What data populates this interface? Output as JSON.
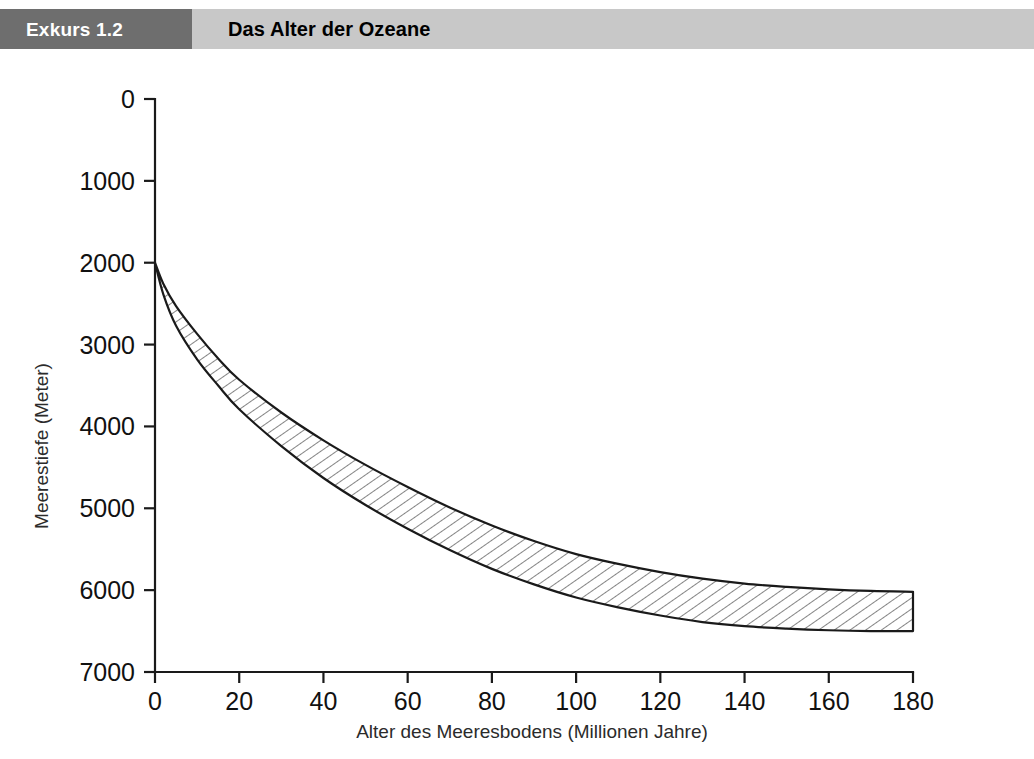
{
  "header": {
    "excursus_label": "Exkurs 1.2",
    "title": "Das Alter der Ozeane",
    "dark_box_color": "#6e6e6e",
    "light_bar_color": "#c8c8c8",
    "excursus_text_color": "#ffffff",
    "title_text_color": "#000000"
  },
  "chart_data": {
    "type": "area",
    "title": "Das Alter der Ozeane",
    "xlabel": "Alter des Meeresbodens (Millionen Jahre)",
    "ylabel": "Meerestiefe (Meter)",
    "xlim": [
      0,
      180
    ],
    "ylim": [
      0,
      7000
    ],
    "y_inverted": true,
    "grid": false,
    "legend": null,
    "xticks": [
      0,
      20,
      40,
      60,
      80,
      100,
      120,
      140,
      160,
      180
    ],
    "xtick_labels": [
      "0",
      "20",
      "40",
      "60",
      "80",
      "100",
      "120",
      "140",
      "160",
      "180"
    ],
    "yticks": [
      0,
      1000,
      2000,
      3000,
      4000,
      5000,
      6000,
      7000
    ],
    "ytick_labels": [
      "0",
      "1000",
      "2000",
      "3000",
      "4000",
      "5000",
      "6000",
      "7000"
    ],
    "fill_style": "diagonal-hatch",
    "line_color": "#1a1a1a",
    "x": [
      0,
      2,
      5,
      10,
      15,
      20,
      30,
      40,
      50,
      60,
      70,
      80,
      90,
      100,
      110,
      120,
      130,
      140,
      150,
      160,
      170,
      180
    ],
    "series": [
      {
        "name": "Obere Begrenzung (flachere Meerestiefe)",
        "values": [
          2000,
          2260,
          2530,
          2870,
          3170,
          3430,
          3830,
          4170,
          4470,
          4740,
          4990,
          5210,
          5400,
          5560,
          5680,
          5780,
          5860,
          5920,
          5960,
          5990,
          6010,
          6020
        ]
      },
      {
        "name": "Untere Begrenzung (groessere Meerestiefe)",
        "values": [
          2000,
          2390,
          2770,
          3180,
          3500,
          3790,
          4240,
          4630,
          4960,
          5250,
          5510,
          5740,
          5930,
          6090,
          6210,
          6310,
          6390,
          6440,
          6470,
          6490,
          6500,
          6500
        ]
      }
    ]
  }
}
